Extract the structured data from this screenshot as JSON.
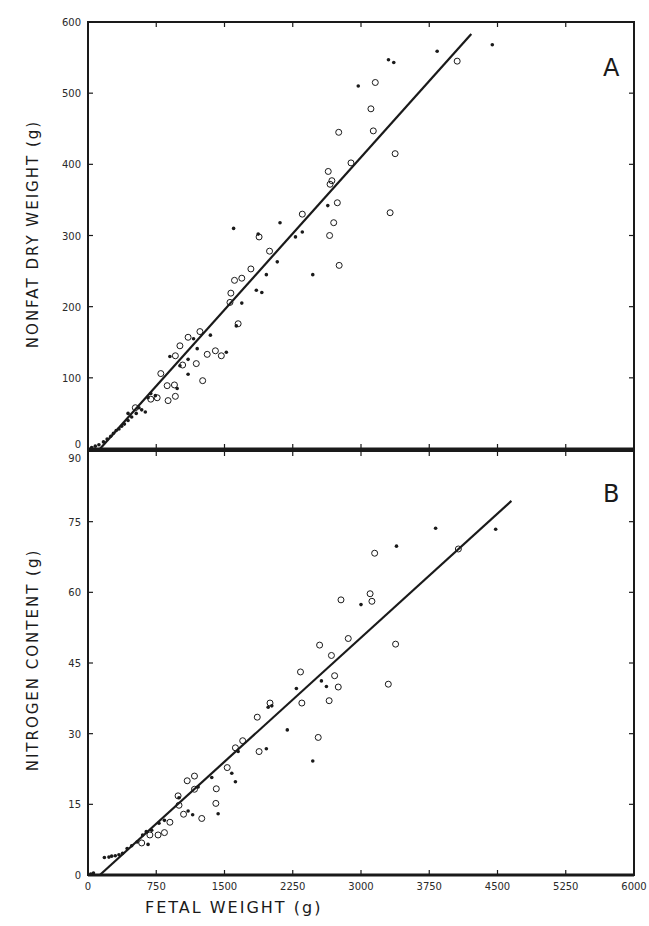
{
  "figure": {
    "panel_a_letter": "A",
    "panel_b_letter": "B",
    "x_axis_title": "FETAL WEIGHT (g)",
    "panel_a_y_title": "NONFAT DRY WEIGHT (g)",
    "panel_b_y_title": "NITROGEN CONTENT (g)",
    "x_tick_labels": [
      "0",
      "750",
      "1500",
      "2250",
      "3000",
      "3750",
      "4500",
      "5250",
      "6000"
    ],
    "panel_a_y_tick_labels": [
      "0",
      "100",
      "200",
      "300",
      "400",
      "500",
      "600"
    ],
    "panel_b_y_tick_labels": [
      "0",
      "15",
      "30",
      "45",
      "60",
      "75",
      "90"
    ],
    "ink_color": "#1a1a1a"
  },
  "chart_data": [
    {
      "type": "scatter",
      "panel": "A",
      "title": "",
      "xlabel": "FETAL WEIGHT (g)",
      "ylabel": "NONFAT DRY WEIGHT (g)",
      "xlim": [
        0,
        6000
      ],
      "ylim": [
        0,
        600
      ],
      "x_ticks": [
        0,
        750,
        1500,
        2250,
        3000,
        3750,
        4500,
        5250,
        6000
      ],
      "y_ticks": [
        0,
        100,
        200,
        300,
        400,
        500,
        600
      ],
      "grid": false,
      "legend": null,
      "regression_line": {
        "x": [
          130,
          4212
        ],
        "y": [
          0,
          583
        ]
      },
      "series": [
        {
          "name": "open circles",
          "marker": "open-circle",
          "points": [
            [
              4057,
              545
            ],
            [
              3157,
              515
            ],
            [
              3109,
              478
            ],
            [
              3135,
              447
            ],
            [
              3375,
              415
            ],
            [
              2755,
              445
            ],
            [
              3320,
              332
            ],
            [
              2890,
              402
            ],
            [
              2640,
              390
            ],
            [
              2680,
              377
            ],
            [
              2660,
              372
            ],
            [
              2740,
              346
            ],
            [
              2700,
              318
            ],
            [
              2355,
              330
            ],
            [
              2655,
              300
            ],
            [
              2760,
              258
            ],
            [
              1880,
              298
            ],
            [
              1995,
              278
            ],
            [
              1690,
              240
            ],
            [
              1610,
              237
            ],
            [
              1790,
              253
            ],
            [
              1570,
              219
            ],
            [
              1650,
              176
            ],
            [
              1560,
              206
            ],
            [
              1400,
              138
            ],
            [
              1310,
              133
            ],
            [
              1465,
              131
            ],
            [
              1230,
              165
            ],
            [
              1100,
              157
            ],
            [
              1010,
              145
            ],
            [
              960,
              131
            ],
            [
              1190,
              120
            ],
            [
              1040,
              118
            ],
            [
              1260,
              96
            ],
            [
              870,
              89
            ],
            [
              800,
              106
            ],
            [
              950,
              90
            ],
            [
              760,
              72
            ],
            [
              880,
              68
            ],
            [
              960,
              74
            ],
            [
              690,
              70
            ],
            [
              520,
              58
            ]
          ]
        },
        {
          "name": "filled dots",
          "marker": "dot",
          "points": [
            [
              4443,
              568
            ],
            [
              3837,
              559
            ],
            [
              3302,
              547
            ],
            [
              3360,
              543
            ],
            [
              2970,
              510
            ],
            [
              2110,
              318
            ],
            [
              1870,
              302
            ],
            [
              2080,
              263
            ],
            [
              1910,
              220
            ],
            [
              2470,
              245
            ],
            [
              2635,
              342
            ],
            [
              2355,
              305
            ],
            [
              2280,
              298
            ],
            [
              1960,
              245
            ],
            [
              1600,
              310
            ],
            [
              1850,
              223
            ],
            [
              1630,
              173
            ],
            [
              1690,
              205
            ],
            [
              1520,
              136
            ],
            [
              1345,
              160
            ],
            [
              1200,
              141
            ],
            [
              1160,
              155
            ],
            [
              1100,
              126
            ],
            [
              1010,
              117
            ],
            [
              900,
              130
            ],
            [
              980,
              85
            ],
            [
              1100,
              105
            ],
            [
              740,
              75
            ],
            [
              630,
              52
            ],
            [
              560,
              58
            ],
            [
              440,
              50
            ]
          ]
        },
        {
          "name": "small cluster (early gestation)",
          "marker": "dot",
          "points": [
            [
              40,
              2
            ],
            [
              80,
              4
            ],
            [
              120,
              6
            ],
            [
              170,
              10
            ],
            [
              210,
              14
            ],
            [
              250,
              18
            ],
            [
              280,
              22
            ],
            [
              310,
              26
            ],
            [
              340,
              28
            ],
            [
              370,
              32
            ],
            [
              400,
              35
            ],
            [
              440,
              40
            ],
            [
              480,
              45
            ],
            [
              530,
              50
            ],
            [
              590,
              55
            ],
            [
              660,
              72
            ],
            [
              690,
              78
            ]
          ]
        }
      ]
    },
    {
      "type": "scatter",
      "panel": "B",
      "title": "",
      "xlabel": "FETAL WEIGHT (g)",
      "ylabel": "NITROGEN CONTENT (g)",
      "xlim": [
        0,
        6000
      ],
      "ylim": [
        0,
        90
      ],
      "x_ticks": [
        0,
        750,
        1500,
        2250,
        3000,
        3750,
        4500,
        5250,
        6000
      ],
      "y_ticks": [
        0,
        15,
        30,
        45,
        60,
        75,
        90
      ],
      "grid": false,
      "legend": null,
      "regression_line": {
        "x": [
          130,
          4653
        ],
        "y": [
          0,
          79.4
        ]
      },
      "series": [
        {
          "name": "open circles",
          "marker": "open-circle",
          "points": [
            [
              4070,
              69.2
            ],
            [
              3150,
              68.3
            ],
            [
              3100,
              59.7
            ],
            [
              3120,
              58.1
            ],
            [
              3380,
              49.0
            ],
            [
              3300,
              40.5
            ],
            [
              2780,
              58.4
            ],
            [
              2860,
              50.2
            ],
            [
              2545,
              48.8
            ],
            [
              2675,
              46.6
            ],
            [
              2710,
              42.3
            ],
            [
              2750,
              39.9
            ],
            [
              2650,
              37.0
            ],
            [
              2335,
              43.1
            ],
            [
              2530,
              29.2
            ],
            [
              2350,
              36.5
            ],
            [
              1860,
              33.5
            ],
            [
              2000,
              36.5
            ],
            [
              1700,
              28.5
            ],
            [
              1620,
              27.0
            ],
            [
              1880,
              26.2
            ],
            [
              1530,
              22.8
            ],
            [
              1410,
              18.3
            ],
            [
              1405,
              15.2
            ],
            [
              1250,
              12.0
            ],
            [
              1170,
              21.0
            ],
            [
              1090,
              20.0
            ],
            [
              1170,
              18.2
            ],
            [
              990,
              16.8
            ],
            [
              1000,
              14.8
            ],
            [
              1050,
              12.9
            ],
            [
              900,
              11.2
            ],
            [
              840,
              9.0
            ],
            [
              770,
              8.5
            ],
            [
              680,
              8.5
            ],
            [
              590,
              6.8
            ]
          ]
        },
        {
          "name": "filled dots",
          "marker": "dot",
          "points": [
            [
              4480,
              73.4
            ],
            [
              3820,
              73.6
            ],
            [
              3390,
              69.8
            ],
            [
              3000,
              57.4
            ],
            [
              2565,
              41.2
            ],
            [
              2290,
              39.6
            ],
            [
              2020,
              35.9
            ],
            [
              1960,
              26.8
            ],
            [
              2190,
              30.8
            ],
            [
              2470,
              24.2
            ],
            [
              2620,
              40.0
            ],
            [
              1980,
              35.6
            ],
            [
              1580,
              21.6
            ],
            [
              1620,
              19.8
            ],
            [
              1360,
              20.7
            ],
            [
              1430,
              13.0
            ],
            [
              1210,
              18.7
            ],
            [
              1150,
              12.8
            ],
            [
              1000,
              16.4
            ],
            [
              840,
              11.6
            ],
            [
              640,
              9.2
            ],
            [
              660,
              6.5
            ],
            [
              1100,
              13.6
            ],
            [
              1650,
              26.2
            ]
          ]
        },
        {
          "name": "small cluster (early gestation)",
          "marker": "dot",
          "points": [
            [
              30,
              0.2
            ],
            [
              60,
              0.4
            ],
            [
              180,
              3.7
            ],
            [
              230,
              3.8
            ],
            [
              260,
              4.0
            ],
            [
              300,
              4.1
            ],
            [
              340,
              4.3
            ],
            [
              380,
              4.6
            ],
            [
              430,
              5.6
            ],
            [
              480,
              6.2
            ],
            [
              540,
              7.0
            ],
            [
              600,
              8.5
            ],
            [
              700,
              9.5
            ],
            [
              780,
              11.0
            ]
          ]
        }
      ]
    }
  ]
}
